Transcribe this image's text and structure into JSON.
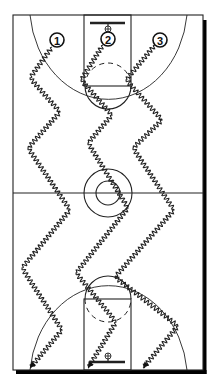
{
  "diagram": {
    "type": "basketball-full-court-drill",
    "colors": {
      "line": "#222222",
      "background": "#ffffff",
      "shadow": "#000000"
    },
    "court": {
      "left": 13,
      "top": 15,
      "right": 203,
      "bottom": 370,
      "half_court_y": 193
    },
    "players": [
      {
        "label": "1",
        "x": 57,
        "y": 40
      },
      {
        "label": "2",
        "x": 108,
        "y": 39
      },
      {
        "label": "3",
        "x": 160,
        "y": 40
      }
    ],
    "paths": [
      {
        "player": "1",
        "points": [
          [
            52,
            47
          ],
          [
            30,
            78
          ],
          [
            60,
            112
          ],
          [
            28,
            148
          ],
          [
            70,
            210
          ],
          [
            22,
            268
          ],
          [
            62,
            330
          ],
          [
            30,
            368
          ]
        ]
      },
      {
        "player": "2",
        "points": [
          [
            103,
            45
          ],
          [
            81,
            80
          ],
          [
            112,
            115
          ],
          [
            88,
            143
          ],
          [
            128,
            208
          ],
          [
            76,
            273
          ],
          [
            116,
            322
          ],
          [
            88,
            368
          ]
        ]
      },
      {
        "player": "3",
        "points": [
          [
            155,
            45
          ],
          [
            126,
            80
          ],
          [
            162,
            120
          ],
          [
            133,
            148
          ],
          [
            174,
            210
          ],
          [
            115,
            277
          ],
          [
            178,
            326
          ],
          [
            143,
            368
          ]
        ]
      }
    ]
  }
}
